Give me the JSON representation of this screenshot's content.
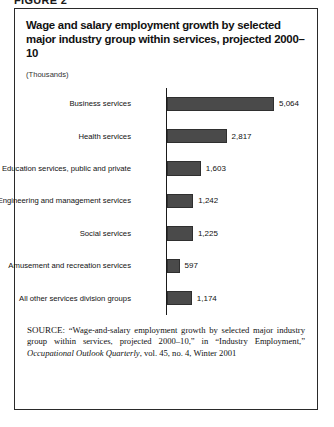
{
  "figure_heading": "FIGURE 2",
  "panel": {
    "title": "Wage and salary employment growth by selected major industry group within services, projected 2000–10",
    "units": "(Thousands)"
  },
  "source_note": {
    "label": "SOURCE:",
    "text_before_italic": " “Wage-and-salary employment growth by selected major industry group within services, projected 2000–10,” in “Industry Employment,” ",
    "italic_title": "Occupational Outlook Quarterly",
    "text_after_italic": ", vol. 45, no. 4, Winter 2001"
  },
  "colors": {
    "bar_fill": "#4a4a4a",
    "bar_stroke": "#2f2f2f",
    "axis": "#1a1a1a",
    "frame": "#2a2a2a"
  },
  "chart_data": {
    "type": "bar",
    "orientation": "horizontal",
    "title": "Wage and salary employment growth by selected major industry group within services, projected 2000–10",
    "xlabel": "",
    "ylabel": "",
    "units": "Thousands",
    "grid": false,
    "legend": false,
    "xlim": [
      0,
      5064
    ],
    "categories": [
      "Business services",
      "Health services",
      "Education services, public and private",
      "Engineering and management services",
      "Social services",
      "Amusement and recreation services",
      "All other services division groups"
    ],
    "values": [
      5064,
      2817,
      1603,
      1242,
      1225,
      597,
      1174
    ],
    "value_labels": [
      "5,064",
      "2,817",
      "1,603",
      "1,242",
      "1,225",
      "597",
      "1,174"
    ]
  }
}
